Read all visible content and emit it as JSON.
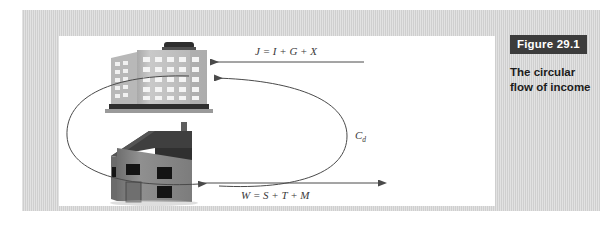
{
  "figure": {
    "badge_label": "Figure 29.1",
    "caption_line1": "The circular",
    "caption_line2": "flow of income"
  },
  "diagram": {
    "type": "circular-flow",
    "nodes": [
      {
        "id": "firms",
        "icon": "office-building-icon",
        "position": "top"
      },
      {
        "id": "households",
        "icon": "house-icon",
        "position": "bottom"
      }
    ],
    "flows": [
      {
        "id": "injections",
        "label": "J = I + G + X",
        "direction": "into-firms",
        "shape": "straight-arrow-left"
      },
      {
        "id": "domestic-consumption",
        "label": "C",
        "subscript": "d",
        "direction": "households-to-firms",
        "shape": "curve-right"
      },
      {
        "id": "withdrawals",
        "label": "W = S + T + M",
        "direction": "out-of-households",
        "shape": "straight-arrow-right"
      },
      {
        "id": "incomes",
        "label": "",
        "direction": "firms-to-households",
        "shape": "curve-left"
      }
    ]
  },
  "colors": {
    "plate": "#d2d2d2",
    "canvas": "#ffffff",
    "badge_background": "#3c3c3c",
    "badge_text": "#ffffff",
    "caption_text": "#1c1c1c",
    "arrow": "#4a4a4a",
    "building_body": "#bcbcbc",
    "building_roof": "#3a3a3a",
    "house_body": "#8c8c8c",
    "house_roof": "#3f3f3f"
  }
}
